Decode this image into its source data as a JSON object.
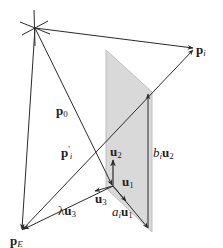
{
  "diagram": {
    "type": "vector-geometry",
    "colors": {
      "line": "#2a2a2a",
      "plane_fill": "#d9d9d9",
      "plane_edge": "#bdbdbd",
      "background": "#ffffff"
    },
    "labels": {
      "p_i": {
        "main": "p",
        "sub": "i"
      },
      "p_0": {
        "main": "p",
        "sub": "0"
      },
      "p_prime_i": {
        "main": "p",
        "sup": "'",
        "sub": "i"
      },
      "u_2": {
        "main": "u",
        "sub": "2"
      },
      "u_1": {
        "main": "u",
        "sub": "1"
      },
      "u_3": {
        "main": "u",
        "sub": "3"
      },
      "b_i_u_2": {
        "coef": "b",
        "coef_sub": "i",
        "main": "u",
        "sub": "2"
      },
      "a_i_u_1": {
        "coef": "a",
        "coef_sub": "i",
        "main": "u",
        "sub": "1"
      },
      "lambda_u_3": {
        "coef": "λ",
        "main": "u",
        "sub": "3"
      },
      "p_E": {
        "main": "p",
        "sub": "E"
      }
    }
  }
}
